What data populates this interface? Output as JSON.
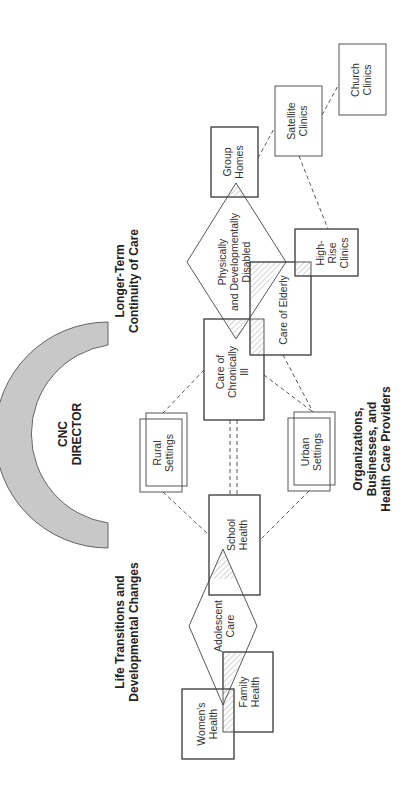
{
  "diagram": {
    "center": {
      "title_line1": "CNC",
      "title_line2": "DIRECTOR"
    },
    "themes": {
      "longer_term": {
        "line1": "Longer-Term",
        "line2": "Continuity of Care"
      },
      "life_transitions": {
        "line1": "Life Transitions and",
        "line2": "Developmental Changes"
      },
      "organizations": {
        "line1": "Organizations,",
        "line2": "Businesses, and",
        "line3": "Health Care Providers"
      }
    },
    "nodes": {
      "group_homes": {
        "line1": "Group",
        "line2": "Homes"
      },
      "satellite_clinics": {
        "line1": "Satellite",
        "line2": "Clinics"
      },
      "church_clinics": {
        "line1": "Church",
        "line2": "Clinics"
      },
      "physically_disabled": {
        "line1": "Physically",
        "line2": "and Developmentally",
        "line3": "Disabled"
      },
      "high_rise_clinics": {
        "line1": "High-",
        "line2": "Rise",
        "line3": "Clinics"
      },
      "care_of_elderly": {
        "line1": "Care of Elderly"
      },
      "care_chronically_ill": {
        "line1": "Care of",
        "line2": "Chronically",
        "line3": "Ill"
      },
      "rural_settings": {
        "line1": "Rural",
        "line2": "Settings"
      },
      "urban_settings": {
        "line1": "Urban",
        "line2": "Settings"
      },
      "school_health": {
        "line1": "School",
        "line2": "Health"
      },
      "adolescent_care": {
        "line1": "Adolescent",
        "line2": "Care"
      },
      "family_health": {
        "line1": "Family",
        "line2": "Health"
      },
      "womens_health": {
        "line1": "Women's",
        "line2": "Health"
      }
    },
    "colors": {
      "arc_fill": "#c8c8c8",
      "stroke": "#444444"
    }
  }
}
